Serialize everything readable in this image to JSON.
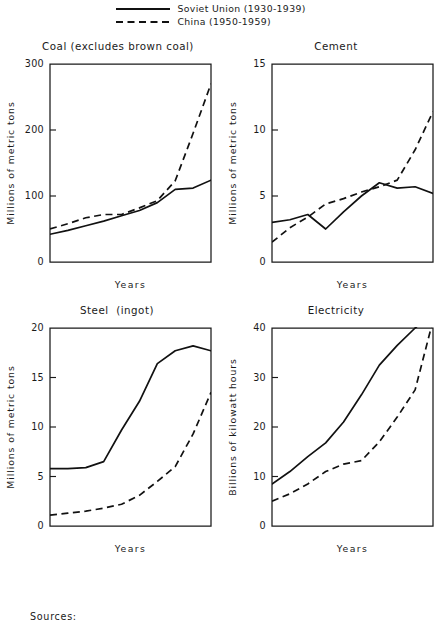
{
  "legend": {
    "entries": [
      {
        "label": "Soviet Union (1930-1939)",
        "style": "solid",
        "swatch_icon": "solid-line-icon"
      },
      {
        "label": "China (1950-1959)",
        "style": "dashed",
        "swatch_icon": "dashed-line-icon"
      }
    ]
  },
  "footer": {
    "sources_label": "Sources:"
  },
  "chart_data": [
    {
      "id": "coal",
      "type": "line",
      "title": "Coal (excludes brown coal)",
      "xlabel": "Years",
      "ylabel": "Millions of metric tons",
      "ylim": [
        0,
        300
      ],
      "yticks": [
        0,
        100,
        200,
        300
      ],
      "ytick_labels": [
        "0",
        "100",
        "200",
        "300"
      ],
      "xlim": [
        0,
        9
      ],
      "xticks": [],
      "xtick_labels": [],
      "grid": false,
      "legend_position": "figure-top",
      "x": [
        0,
        1,
        2,
        3,
        4,
        5,
        6,
        7,
        8,
        9
      ],
      "series": [
        {
          "name": "Soviet Union (1930-1939)",
          "style": "solid",
          "values": [
            42,
            48,
            55,
            62,
            70,
            78,
            90,
            110,
            112,
            124
          ]
        },
        {
          "name": "China (1950-1959)",
          "style": "dashed",
          "values": [
            50,
            58,
            67,
            72,
            72,
            82,
            93,
            123,
            195,
            270
          ]
        }
      ]
    },
    {
      "id": "cement",
      "type": "line",
      "title": "Cement",
      "xlabel": "Years",
      "ylabel": "Millions of metric tons",
      "ylim": [
        0,
        15
      ],
      "yticks": [
        0,
        5,
        10,
        15
      ],
      "ytick_labels": [
        "0",
        "5",
        "10",
        "15"
      ],
      "xlim": [
        0,
        9
      ],
      "xticks": [],
      "xtick_labels": [],
      "grid": false,
      "legend_position": "figure-top",
      "x": [
        0,
        1,
        2,
        3,
        4,
        5,
        6,
        7,
        8,
        9
      ],
      "series": [
        {
          "name": "Soviet Union (1930-1939)",
          "style": "solid",
          "values": [
            3.0,
            3.2,
            3.6,
            2.5,
            3.8,
            5.0,
            6.0,
            5.6,
            5.7,
            5.2
          ]
        },
        {
          "name": "China (1950-1959)",
          "style": "dashed",
          "values": [
            1.5,
            2.6,
            3.4,
            4.4,
            4.8,
            5.3,
            5.7,
            6.2,
            8.5,
            11.4
          ]
        }
      ]
    },
    {
      "id": "steel",
      "type": "line",
      "title": "Steel  (ingot)",
      "xlabel": "Years",
      "ylabel": "Millions of metric tons",
      "ylim": [
        0,
        20
      ],
      "yticks": [
        0,
        5,
        10,
        15,
        20
      ],
      "ytick_labels": [
        "0",
        "5",
        "10",
        "15",
        "20"
      ],
      "xlim": [
        0,
        9
      ],
      "xticks": [],
      "xtick_labels": [],
      "grid": false,
      "legend_position": "figure-top",
      "x": [
        0,
        1,
        2,
        3,
        4,
        5,
        6,
        7,
        8,
        9
      ],
      "series": [
        {
          "name": "Soviet Union (1930-1939)",
          "style": "solid",
          "values": [
            5.8,
            5.8,
            5.9,
            6.5,
            9.7,
            12.6,
            16.4,
            17.7,
            18.2,
            17.7
          ]
        },
        {
          "name": "China (1950-1959)",
          "style": "dashed",
          "values": [
            1.1,
            1.3,
            1.5,
            1.8,
            2.2,
            3.1,
            4.5,
            6.0,
            9.3,
            13.5
          ]
        }
      ]
    },
    {
      "id": "electricity",
      "type": "line",
      "title": "Electricity",
      "xlabel": "Years",
      "ylabel": "Billions of kilowatt hours",
      "ylim": [
        0,
        40
      ],
      "yticks": [
        0,
        10,
        20,
        30,
        40
      ],
      "ytick_labels": [
        "0",
        "10",
        "20",
        "30",
        "40"
      ],
      "xlim": [
        0,
        9
      ],
      "xticks": [],
      "xtick_labels": [],
      "grid": false,
      "legend_position": "figure-top",
      "x": [
        0,
        1,
        2,
        3,
        4,
        5,
        6,
        7,
        8,
        9
      ],
      "series": [
        {
          "name": "Soviet Union (1930-1939)",
          "style": "solid",
          "values": [
            8.5,
            11.0,
            14.0,
            16.8,
            21.0,
            26.5,
            32.5,
            36.5,
            40.0,
            43.0
          ]
        },
        {
          "name": "China (1950-1959)",
          "style": "dashed",
          "values": [
            5.0,
            6.5,
            8.5,
            11.0,
            12.5,
            13.2,
            17.0,
            22.0,
            27.5,
            41.5
          ]
        }
      ]
    }
  ]
}
